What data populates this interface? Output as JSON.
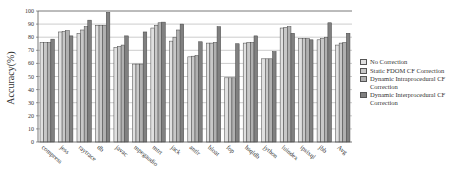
{
  "chart_data": {
    "type": "bar",
    "title": "",
    "xlabel": "",
    "ylabel": "Accuracy(%)",
    "ylim": [
      0,
      100
    ],
    "yticks": [
      0,
      10,
      20,
      30,
      40,
      50,
      60,
      70,
      80,
      90,
      100
    ],
    "grid": true,
    "legend_position": "right",
    "categories": [
      "compress",
      "jess",
      "raytrace",
      "db",
      "javac",
      "mpegaudio",
      "mtrt",
      "jack",
      "antlr",
      "bloat",
      "fop",
      "hsqldb",
      "jython",
      "luindex",
      "ipsixql",
      "jbb",
      "Avg"
    ],
    "series": [
      {
        "name": "No Correction",
        "color": "#e0e0e0",
        "values": [
          76,
          84,
          83,
          89,
          72,
          59.5,
          87,
          77,
          65,
          75.5,
          49,
          75.5,
          63.5,
          87,
          79,
          78,
          74
        ]
      },
      {
        "name": "Static FDOM CF Correction",
        "color": "#c8c8c8",
        "values": [
          76,
          84.5,
          85.5,
          89,
          73,
          59.5,
          89,
          80,
          65.5,
          75.5,
          49,
          76,
          63.5,
          87.5,
          79,
          79,
          75.5
        ]
      },
      {
        "name": "Dynamic Intraprocedural CF Correction",
        "color": "#b0b0b0",
        "values": [
          76,
          85,
          88,
          89,
          74,
          59.5,
          91,
          85.5,
          66,
          76,
          49,
          76,
          63.5,
          88,
          79,
          80,
          76
        ]
      },
      {
        "name": "Dynamic Interprocedural CF Correction",
        "color": "#808080",
        "values": [
          78.5,
          81,
          93,
          99,
          81,
          84,
          91.5,
          90,
          76.5,
          88,
          75,
          81,
          69,
          83,
          78,
          91,
          83
        ]
      }
    ]
  },
  "legend": {
    "items": [
      "No Correction",
      "Static FDOM CF Correction",
      "Dynamic Intraprocedural CF Correction",
      "Dynamic Interprocedural CF Correction"
    ]
  }
}
